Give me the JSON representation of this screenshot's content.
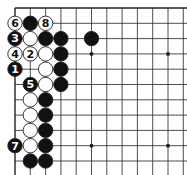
{
  "diagram": {
    "type": "go-board-corner",
    "grid": {
      "cols": 12,
      "rows": 11,
      "x0": 15,
      "y0": 8,
      "dx": 15.3,
      "dy": 15.3,
      "edges": [
        "top",
        "left"
      ]
    },
    "hoshi": [
      [
        5,
        3
      ],
      [
        10,
        3
      ],
      [
        10,
        9
      ],
      [
        5,
        9
      ]
    ],
    "stones": [
      {
        "c": 0,
        "r": 1,
        "color": "white",
        "label": "6"
      },
      {
        "c": 1,
        "r": 1,
        "color": "black",
        "label": ""
      },
      {
        "c": 2,
        "r": 1,
        "color": "white",
        "label": "8"
      },
      {
        "c": 0,
        "r": 2,
        "color": "black",
        "label": "3"
      },
      {
        "c": 1,
        "r": 2,
        "color": "white",
        "label": ""
      },
      {
        "c": 2,
        "r": 2,
        "color": "black",
        "label": ""
      },
      {
        "c": 3,
        "r": 2,
        "color": "black",
        "label": ""
      },
      {
        "c": 5,
        "r": 2,
        "color": "black",
        "label": ""
      },
      {
        "c": 0,
        "r": 3,
        "color": "white",
        "label": "4"
      },
      {
        "c": 1,
        "r": 3,
        "color": "white",
        "label": "2"
      },
      {
        "c": 2,
        "r": 3,
        "color": "white",
        "label": ""
      },
      {
        "c": 3,
        "r": 3,
        "color": "black",
        "label": ""
      },
      {
        "c": 0,
        "r": 4,
        "color": "black",
        "label": "1"
      },
      {
        "c": 2,
        "r": 4,
        "color": "white",
        "label": ""
      },
      {
        "c": 3,
        "r": 4,
        "color": "black",
        "label": ""
      },
      {
        "c": 1,
        "r": 5,
        "color": "black",
        "label": "5"
      },
      {
        "c": 2,
        "r": 5,
        "color": "white",
        "label": ""
      },
      {
        "c": 3,
        "r": 5,
        "color": "black",
        "label": ""
      },
      {
        "c": 1,
        "r": 6,
        "color": "white",
        "label": ""
      },
      {
        "c": 2,
        "r": 6,
        "color": "black",
        "label": ""
      },
      {
        "c": 1,
        "r": 7,
        "color": "white",
        "label": ""
      },
      {
        "c": 2,
        "r": 7,
        "color": "black",
        "label": ""
      },
      {
        "c": 1,
        "r": 8,
        "color": "white",
        "label": ""
      },
      {
        "c": 2,
        "r": 8,
        "color": "black",
        "label": ""
      },
      {
        "c": 0,
        "r": 9,
        "color": "black",
        "label": "7"
      },
      {
        "c": 1,
        "r": 9,
        "color": "white",
        "label": ""
      },
      {
        "c": 2,
        "r": 9,
        "color": "black",
        "label": ""
      },
      {
        "c": 1,
        "r": 10,
        "color": "black",
        "label": ""
      },
      {
        "c": 2,
        "r": 10,
        "color": "black",
        "label": ""
      }
    ],
    "colors": {
      "line": "#222222",
      "black": "#111111",
      "white": "#ffffff",
      "bg": "#ffffff"
    }
  }
}
